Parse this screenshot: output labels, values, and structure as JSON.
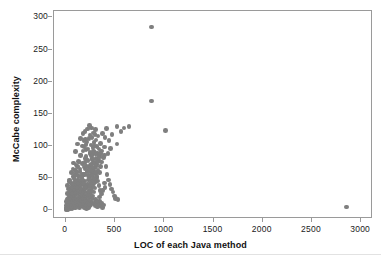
{
  "chart_data": {
    "type": "scatter",
    "title": "",
    "xlabel": "LOC of each Java method",
    "ylabel": "McCabe complexity",
    "xlim": [
      -120,
      3120
    ],
    "ylim": [
      -14,
      310
    ],
    "xticks": [
      0,
      500,
      1000,
      1500,
      2000,
      2500,
      3000
    ],
    "yticks": [
      0,
      50,
      100,
      150,
      200,
      250,
      300
    ],
    "grid": false,
    "legend": null,
    "marker": {
      "shape": "circle",
      "color": "#7f7f7f",
      "size": 4.6
    },
    "points": [
      [
        870,
        285
      ],
      [
        870,
        170
      ],
      [
        1010,
        124
      ],
      [
        2850,
        5
      ],
      [
        640,
        130
      ],
      [
        590,
        128
      ],
      [
        560,
        122
      ],
      [
        520,
        130
      ],
      [
        520,
        103
      ],
      [
        530,
        16
      ],
      [
        470,
        118
      ],
      [
        455,
        96
      ],
      [
        440,
        108
      ],
      [
        430,
        88
      ],
      [
        415,
        127
      ],
      [
        400,
        113
      ],
      [
        395,
        86
      ],
      [
        390,
        98
      ],
      [
        380,
        82
      ],
      [
        375,
        119
      ],
      [
        365,
        92
      ],
      [
        360,
        75
      ],
      [
        355,
        104
      ],
      [
        350,
        68
      ],
      [
        345,
        84
      ],
      [
        340,
        58
      ],
      [
        335,
        95
      ],
      [
        330,
        77
      ],
      [
        325,
        62
      ],
      [
        320,
        88
      ],
      [
        315,
        50
      ],
      [
        312,
        71
      ],
      [
        308,
        44
      ],
      [
        305,
        80
      ],
      [
        300,
        57
      ],
      [
        298,
        34
      ],
      [
        295,
        66
      ],
      [
        292,
        48
      ],
      [
        290,
        90
      ],
      [
        288,
        28
      ],
      [
        285,
        60
      ],
      [
        282,
        41
      ],
      [
        280,
        74
      ],
      [
        278,
        22
      ],
      [
        275,
        53
      ],
      [
        272,
        37
      ],
      [
        270,
        64
      ],
      [
        268,
        18
      ],
      [
        265,
        46
      ],
      [
        262,
        30
      ],
      [
        260,
        58
      ],
      [
        258,
        12
      ],
      [
        255,
        42
      ],
      [
        252,
        25
      ],
      [
        250,
        70
      ],
      [
        248,
        8
      ],
      [
        245,
        36
      ],
      [
        242,
        20
      ],
      [
        240,
        52
      ],
      [
        238,
        6
      ],
      [
        235,
        31
      ],
      [
        232,
        15
      ],
      [
        230,
        47
      ],
      [
        228,
        4
      ],
      [
        225,
        27
      ],
      [
        222,
        11
      ],
      [
        220,
        40
      ],
      [
        218,
        3
      ],
      [
        215,
        23
      ],
      [
        212,
        9
      ],
      [
        210,
        35
      ],
      [
        208,
        2
      ],
      [
        205,
        19
      ],
      [
        202,
        7
      ],
      [
        200,
        110
      ],
      [
        198,
        80
      ],
      [
        196,
        64
      ],
      [
        194,
        45
      ],
      [
        192,
        29
      ],
      [
        190,
        16
      ],
      [
        188,
        5
      ],
      [
        186,
        38
      ],
      [
        184,
        24
      ],
      [
        182,
        12
      ],
      [
        180,
        55
      ],
      [
        178,
        33
      ],
      [
        176,
        21
      ],
      [
        174,
        9
      ],
      [
        172,
        43
      ],
      [
        170,
        100
      ],
      [
        168,
        72
      ],
      [
        166,
        50
      ],
      [
        164,
        31
      ],
      [
        162,
        18
      ],
      [
        160,
        6
      ],
      [
        158,
        27
      ],
      [
        156,
        14
      ],
      [
        154,
        40
      ],
      [
        152,
        22
      ],
      [
        150,
        111
      ],
      [
        148,
        85
      ],
      [
        146,
        60
      ],
      [
        144,
        44
      ],
      [
        142,
        28
      ],
      [
        140,
        15
      ],
      [
        138,
        4
      ],
      [
        136,
        35
      ],
      [
        134,
        20
      ],
      [
        132,
        10
      ],
      [
        130,
        76
      ],
      [
        128,
        53
      ],
      [
        126,
        38
      ],
      [
        124,
        25
      ],
      [
        122,
        13
      ],
      [
        120,
        103
      ],
      [
        118,
        68
      ],
      [
        116,
        47
      ],
      [
        114,
        32
      ],
      [
        112,
        19
      ],
      [
        110,
        8
      ],
      [
        108,
        41
      ],
      [
        106,
        26
      ],
      [
        104,
        14
      ],
      [
        102,
        5
      ],
      [
        100,
        91
      ],
      [
        98,
        62
      ],
      [
        96,
        44
      ],
      [
        94,
        30
      ],
      [
        92,
        17
      ],
      [
        90,
        7
      ],
      [
        88,
        36
      ],
      [
        86,
        23
      ],
      [
        84,
        11
      ],
      [
        82,
        3
      ],
      [
        80,
        73
      ],
      [
        78,
        52
      ],
      [
        76,
        37
      ],
      [
        74,
        24
      ],
      [
        72,
        13
      ],
      [
        70,
        5
      ],
      [
        68,
        30
      ],
      [
        66,
        18
      ],
      [
        64,
        9
      ],
      [
        62,
        2
      ],
      [
        60,
        58
      ],
      [
        58,
        42
      ],
      [
        56,
        29
      ],
      [
        54,
        18
      ],
      [
        52,
        9
      ],
      [
        50,
        3
      ],
      [
        48,
        24
      ],
      [
        46,
        14
      ],
      [
        44,
        7
      ],
      [
        42,
        2
      ],
      [
        40,
        47
      ],
      [
        38,
        33
      ],
      [
        36,
        22
      ],
      [
        34,
        13
      ],
      [
        32,
        6
      ],
      [
        30,
        2
      ],
      [
        28,
        18
      ],
      [
        26,
        10
      ],
      [
        24,
        4
      ],
      [
        22,
        1
      ],
      [
        20,
        38
      ],
      [
        18,
        26
      ],
      [
        16,
        17
      ],
      [
        14,
        10
      ],
      [
        12,
        5
      ],
      [
        10,
        1
      ],
      [
        8,
        13
      ],
      [
        6,
        7
      ],
      [
        4,
        3
      ],
      [
        2,
        1
      ],
      [
        125,
        53
      ],
      [
        135,
        75
      ],
      [
        145,
        64
      ],
      [
        155,
        86
      ],
      [
        165,
        56
      ],
      [
        175,
        92
      ],
      [
        185,
        67
      ],
      [
        195,
        74
      ],
      [
        205,
        83
      ],
      [
        215,
        59
      ],
      [
        225,
        77
      ],
      [
        235,
        66
      ],
      [
        245,
        88
      ],
      [
        255,
        71
      ],
      [
        265,
        80
      ],
      [
        175,
        119
      ],
      [
        195,
        122
      ],
      [
        215,
        106
      ],
      [
        185,
        98
      ],
      [
        205,
        94
      ],
      [
        235,
        111
      ],
      [
        255,
        101
      ],
      [
        275,
        97
      ],
      [
        245,
        117
      ],
      [
        265,
        113
      ],
      [
        285,
        105
      ],
      [
        295,
        118
      ],
      [
        305,
        109
      ],
      [
        315,
        99
      ],
      [
        325,
        115
      ],
      [
        75,
        64
      ],
      [
        85,
        49
      ],
      [
        95,
        55
      ],
      [
        105,
        70
      ],
      [
        115,
        58
      ],
      [
        65,
        40
      ],
      [
        55,
        35
      ],
      [
        45,
        29
      ],
      [
        35,
        44
      ],
      [
        25,
        33
      ],
      [
        290,
        10
      ],
      [
        300,
        7
      ],
      [
        310,
        12
      ],
      [
        320,
        5
      ],
      [
        330,
        9
      ],
      [
        340,
        14
      ],
      [
        350,
        6
      ],
      [
        360,
        11
      ],
      [
        370,
        4
      ],
      [
        380,
        8
      ],
      [
        262,
        85
      ],
      [
        272,
        79
      ],
      [
        282,
        92
      ],
      [
        292,
        73
      ],
      [
        302,
        87
      ],
      [
        150,
        9
      ],
      [
        160,
        12
      ],
      [
        170,
        6
      ],
      [
        180,
        10
      ],
      [
        190,
        3
      ],
      [
        200,
        13
      ],
      [
        210,
        7
      ],
      [
        220,
        11
      ],
      [
        230,
        5
      ],
      [
        240,
        9
      ],
      [
        118,
        11
      ],
      [
        128,
        6
      ],
      [
        138,
        9
      ],
      [
        108,
        8
      ],
      [
        98,
        4
      ],
      [
        88,
        12
      ],
      [
        78,
        7
      ],
      [
        68,
        10
      ],
      [
        58,
        5
      ],
      [
        48,
        8
      ],
      [
        258,
        62
      ],
      [
        268,
        54
      ],
      [
        278,
        66
      ],
      [
        288,
        49
      ],
      [
        298,
        58
      ],
      [
        308,
        67
      ],
      [
        318,
        52
      ],
      [
        328,
        45
      ],
      [
        338,
        38
      ],
      [
        348,
        30
      ],
      [
        220,
        61
      ],
      [
        230,
        54
      ],
      [
        240,
        48
      ],
      [
        250,
        41
      ],
      [
        212,
        68
      ],
      [
        172,
        47
      ],
      [
        182,
        41
      ],
      [
        192,
        55
      ],
      [
        202,
        36
      ],
      [
        162,
        52
      ],
      [
        132,
        46
      ],
      [
        142,
        39
      ],
      [
        152,
        33
      ],
      [
        122,
        41
      ],
      [
        112,
        35
      ],
      [
        92,
        27
      ],
      [
        82,
        31
      ],
      [
        72,
        22
      ],
      [
        62,
        26
      ],
      [
        52,
        20
      ],
      [
        42,
        17
      ],
      [
        32,
        12
      ],
      [
        22,
        8
      ],
      [
        12,
        4
      ],
      [
        2,
        2
      ],
      [
        390,
        42
      ],
      [
        400,
        35
      ],
      [
        375,
        30
      ],
      [
        360,
        25
      ],
      [
        345,
        20
      ],
      [
        225,
        95
      ],
      [
        205,
        102
      ],
      [
        245,
        90
      ],
      [
        265,
        86
      ],
      [
        185,
        108
      ],
      [
        300,
        125
      ],
      [
        280,
        120
      ],
      [
        260,
        128
      ],
      [
        240,
        132
      ],
      [
        220,
        126
      ],
      [
        350,
        88
      ],
      [
        335,
        82
      ],
      [
        320,
        76
      ],
      [
        305,
        70
      ],
      [
        290,
        100
      ],
      [
        410,
        68
      ],
      [
        420,
        55
      ],
      [
        435,
        47
      ],
      [
        450,
        40
      ],
      [
        465,
        33
      ],
      [
        480,
        28
      ],
      [
        495,
        22
      ],
      [
        505,
        18
      ],
      [
        300,
        16
      ],
      [
        315,
        13
      ]
    ]
  },
  "axes": {
    "x_tick_labels": [
      "0",
      "500",
      "1000",
      "1500",
      "2000",
      "2500",
      "3000"
    ],
    "y_tick_labels": [
      "0",
      "50",
      "100",
      "150",
      "200",
      "250",
      "300"
    ]
  }
}
